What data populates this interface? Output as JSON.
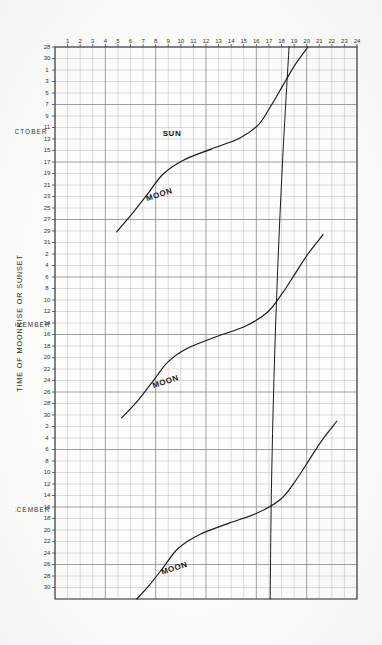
{
  "figure": {
    "caption_bottom": "TIME OF MOONRISE OR SUNSET",
    "ink_color": "#1a1a1a",
    "grid_color": "#8e8e96",
    "grid_minor_color": "#b9b9c0",
    "paper_color": "#fdfdfc"
  },
  "labels": {
    "sun": "SUN",
    "moon_1": "MOON",
    "moon_2": "MOON",
    "moon_3": "MOON",
    "month_october": "OCTOBER",
    "month_november": "NOVEMBER",
    "month_december": "DECEMBER"
  },
  "chart_data": {
    "type": "line",
    "title": "",
    "xlabel": "",
    "ylabel": "TIME OF MOONRISE OR SUNSET",
    "orientation": "rotated-90-on-page",
    "grid": true,
    "legend": "inline-curve-labels",
    "xaxis": {
      "name": "date",
      "ticks": [
        "28",
        "30",
        "1",
        "3",
        "5",
        "7",
        "9",
        "11",
        "13",
        "15",
        "17",
        "19",
        "21",
        "23",
        "25",
        "27",
        "29",
        "31",
        "2",
        "4",
        "6",
        "8",
        "10",
        "12",
        "14",
        "16",
        "18",
        "20",
        "22",
        "24",
        "26",
        "28",
        "30",
        "2",
        "4",
        "6",
        "8",
        "10",
        "12",
        "14",
        "16",
        "18",
        "20",
        "22",
        "24",
        "26",
        "28",
        "30"
      ],
      "tick_count": 49,
      "tick_interval_days": 2,
      "months": [
        "OCTOBER",
        "NOVEMBER",
        "DECEMBER"
      ],
      "range_start": "September 28",
      "range_end": "December 30"
    },
    "yaxis": {
      "name": "hour",
      "label": "TIME OF MOONRISE OR SUNSET",
      "ticks": [
        1,
        2,
        3,
        4,
        5,
        6,
        7,
        8,
        9,
        10,
        11,
        12,
        13,
        14,
        15,
        16,
        17,
        18,
        19,
        20,
        21,
        22,
        23,
        24
      ],
      "ylim": [
        0,
        24
      ],
      "direction": "increasing-upward"
    },
    "series": [
      {
        "name": "SUN",
        "style": "near-vertical-straight-line",
        "description": "Sunset time, nearly constant near 17-18h, sloping slightly earlier across the season",
        "points": [
          {
            "x": 0.0,
            "y": 18.6
          },
          {
            "x": 0.2,
            "y": 18.1
          },
          {
            "x": 0.4,
            "y": 17.7
          },
          {
            "x": 0.6,
            "y": 17.4
          },
          {
            "x": 0.8,
            "y": 17.2
          },
          {
            "x": 1.0,
            "y": 17.1
          }
        ]
      },
      {
        "name": "MOON-1",
        "style": "descending-s-curve",
        "month_span": "October",
        "points": [
          {
            "x": 0.0,
            "y": 20.1
          },
          {
            "x": 0.035,
            "y": 19.0
          },
          {
            "x": 0.07,
            "y": 18.1
          },
          {
            "x": 0.105,
            "y": 17.2
          },
          {
            "x": 0.14,
            "y": 16.2
          },
          {
            "x": 0.165,
            "y": 14.7
          },
          {
            "x": 0.185,
            "y": 12.4
          },
          {
            "x": 0.205,
            "y": 10.2
          },
          {
            "x": 0.23,
            "y": 8.6
          },
          {
            "x": 0.265,
            "y": 7.4
          },
          {
            "x": 0.3,
            "y": 6.2
          },
          {
            "x": 0.335,
            "y": 4.9
          }
        ]
      },
      {
        "name": "MOON-2",
        "style": "descending-s-curve",
        "month_span": "November",
        "points": [
          {
            "x": 0.34,
            "y": 21.3
          },
          {
            "x": 0.375,
            "y": 20.1
          },
          {
            "x": 0.41,
            "y": 19.1
          },
          {
            "x": 0.445,
            "y": 18.1
          },
          {
            "x": 0.48,
            "y": 16.9
          },
          {
            "x": 0.505,
            "y": 15.2
          },
          {
            "x": 0.525,
            "y": 12.8
          },
          {
            "x": 0.545,
            "y": 10.6
          },
          {
            "x": 0.57,
            "y": 9.0
          },
          {
            "x": 0.605,
            "y": 7.8
          },
          {
            "x": 0.64,
            "y": 6.6
          },
          {
            "x": 0.672,
            "y": 5.3
          }
        ]
      },
      {
        "name": "MOON-3",
        "style": "descending-s-curve",
        "month_span": "December",
        "points": [
          {
            "x": 0.678,
            "y": 22.4
          },
          {
            "x": 0.713,
            "y": 21.2
          },
          {
            "x": 0.748,
            "y": 20.2
          },
          {
            "x": 0.783,
            "y": 19.2
          },
          {
            "x": 0.818,
            "y": 18.0
          },
          {
            "x": 0.843,
            "y": 16.2
          },
          {
            "x": 0.863,
            "y": 13.8
          },
          {
            "x": 0.883,
            "y": 11.5
          },
          {
            "x": 0.908,
            "y": 9.8
          },
          {
            "x": 0.943,
            "y": 8.6
          },
          {
            "x": 0.975,
            "y": 7.5
          },
          {
            "x": 1.0,
            "y": 6.5
          }
        ]
      }
    ]
  }
}
